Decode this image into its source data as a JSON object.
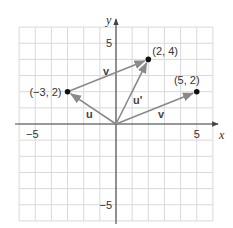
{
  "diagram": {
    "type": "vector-coordinate-plane",
    "axes": {
      "x_label": "x",
      "y_label": "y",
      "x_range": [
        -6,
        6
      ],
      "y_range": [
        -6,
        6
      ],
      "x_ticks": [
        {
          "value": -5,
          "label": "−5"
        },
        {
          "value": 5,
          "label": "5"
        }
      ],
      "y_ticks": [
        {
          "value": 5,
          "label": "5"
        },
        {
          "value": -5,
          "label": "−5"
        }
      ],
      "grid": true
    },
    "points": [
      {
        "name": "point-neg3-2",
        "x": -3,
        "y": 2,
        "label": "(−3, 2)"
      },
      {
        "name": "point-2-4",
        "x": 2,
        "y": 4,
        "label": "(2, 4)"
      },
      {
        "name": "point-5-2",
        "x": 5,
        "y": 2,
        "label": "(5, 2)"
      }
    ],
    "vectors": [
      {
        "name": "vector-u",
        "from": [
          0,
          0
        ],
        "to": [
          -3,
          2
        ],
        "label": "u"
      },
      {
        "name": "vector-v-top",
        "from": [
          -3,
          2
        ],
        "to": [
          2,
          4
        ],
        "label": "v"
      },
      {
        "name": "vector-u-prime",
        "from": [
          0,
          0
        ],
        "to": [
          2,
          4
        ],
        "label": "u'"
      },
      {
        "name": "vector-v-bottom",
        "from": [
          0,
          0
        ],
        "to": [
          5,
          2
        ],
        "label": "v"
      }
    ],
    "colors": {
      "grid": "#d9d9d9",
      "axis": "#444444",
      "vector": "#8a8a8a",
      "point": "#111111",
      "text": "#333333"
    }
  }
}
